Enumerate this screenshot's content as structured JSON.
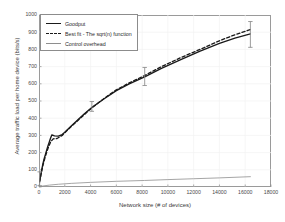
{
  "chart_data": {
    "type": "line",
    "title": "",
    "xlabel": "Network size (# of devices)",
    "ylabel": "Average traffic load per home device (bits/s)",
    "xlim": [
      0,
      18000
    ],
    "ylim": [
      0,
      1000
    ],
    "xticks": [
      0,
      2000,
      4000,
      6000,
      8000,
      10000,
      12000,
      14000,
      16000,
      18000
    ],
    "yticks": [
      0,
      100,
      200,
      300,
      400,
      500,
      600,
      700,
      800,
      900,
      1000
    ],
    "grid": true,
    "legend_position": "upper left",
    "legend": [
      {
        "label": "Goodput",
        "style": "solid",
        "color": "#1a1a1a"
      },
      {
        "label": "Best fit - The sqrt(n) function",
        "style": "dashed",
        "color": "#1a1a1a"
      },
      {
        "label": "Control overhead",
        "style": "solid-thin",
        "color": "#8e8e8e"
      }
    ],
    "series": [
      {
        "name": "Goodput",
        "style": "solid",
        "color": "#1a1a1a",
        "points": [
          [
            50,
            35
          ],
          [
            100,
            55
          ],
          [
            150,
            75
          ],
          [
            200,
            95
          ],
          [
            260,
            118
          ],
          [
            320,
            140
          ],
          [
            400,
            165
          ],
          [
            500,
            190
          ],
          [
            600,
            215
          ],
          [
            700,
            240
          ],
          [
            800,
            262
          ],
          [
            900,
            285
          ],
          [
            1000,
            303
          ],
          [
            1200,
            297
          ],
          [
            1500,
            296
          ],
          [
            1800,
            305
          ],
          [
            2000,
            318
          ],
          [
            2500,
            355
          ],
          [
            3000,
            390
          ],
          [
            3500,
            425
          ],
          [
            4100,
            462
          ],
          [
            5000,
            510
          ],
          [
            6000,
            560
          ],
          [
            7000,
            600
          ],
          [
            8200,
            640
          ],
          [
            9500,
            690
          ],
          [
            11000,
            740
          ],
          [
            12500,
            790
          ],
          [
            14000,
            835
          ],
          [
            15200,
            865
          ],
          [
            16400,
            890
          ]
        ]
      },
      {
        "name": "Best fit - The sqrt(n) function",
        "style": "dashed",
        "color": "#1a1a1a",
        "points": [
          [
            50,
            30
          ],
          [
            150,
            70
          ],
          [
            300,
            125
          ],
          [
            500,
            180
          ],
          [
            700,
            225
          ],
          [
            900,
            262
          ],
          [
            1100,
            280
          ],
          [
            1400,
            282
          ],
          [
            1800,
            300
          ],
          [
            2200,
            330
          ],
          [
            2800,
            372
          ],
          [
            3500,
            420
          ],
          [
            4100,
            460
          ],
          [
            5000,
            512
          ],
          [
            6000,
            565
          ],
          [
            7000,
            605
          ],
          [
            8200,
            648
          ],
          [
            9500,
            700
          ],
          [
            11000,
            752
          ],
          [
            12500,
            800
          ],
          [
            14000,
            850
          ],
          [
            15200,
            885
          ],
          [
            16400,
            915
          ]
        ]
      },
      {
        "name": "Control overhead",
        "style": "solid-thin",
        "color": "#8e8e8e",
        "points": [
          [
            50,
            2
          ],
          [
            300,
            6
          ],
          [
            800,
            11
          ],
          [
            1500,
            16
          ],
          [
            2500,
            21
          ],
          [
            4000,
            27
          ],
          [
            6000,
            33
          ],
          [
            8200,
            38
          ],
          [
            10000,
            43
          ],
          [
            12000,
            48
          ],
          [
            14000,
            53
          ],
          [
            16400,
            60
          ]
        ]
      }
    ],
    "error_bars": [
      {
        "x": 50,
        "y": 45,
        "low": 8,
        "high": 88
      },
      {
        "x": 4100,
        "y": 462,
        "low": 440,
        "high": 497
      },
      {
        "x": 8200,
        "y": 640,
        "low": 590,
        "high": 695
      },
      {
        "x": 16400,
        "y": 890,
        "low": 812,
        "high": 962
      }
    ]
  }
}
